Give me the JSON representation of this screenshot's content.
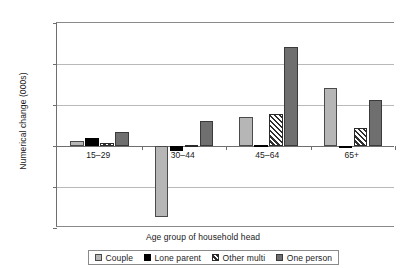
{
  "chart_data": {
    "type": "bar",
    "title": "",
    "xlabel": "Age group of household head",
    "ylabel": "Numerical change (000s)",
    "categories": [
      "15–29",
      "30–44",
      "45–64",
      "65+"
    ],
    "series": [
      {
        "name": "Couple",
        "values": [
          55,
          -870,
          350,
          710
        ]
      },
      {
        "name": "Lone parent",
        "values": [
          95,
          -65,
          10,
          5
        ]
      },
      {
        "name": "Other multi",
        "values": [
          40,
          10,
          390,
          215
        ]
      },
      {
        "name": "One person",
        "values": [
          165,
          300,
          1210,
          560
        ]
      }
    ],
    "ylim": [
      -1000,
      1500
    ],
    "ytick_labels": [
      "1,500",
      "1,000",
      "500",
      "0",
      "-500",
      "-1,000"
    ],
    "ytick_values": [
      1500,
      1000,
      500,
      0,
      -500,
      -1000
    ],
    "grid": true,
    "legend_position": "bottom",
    "colors": {
      "couple": "#b6b6b6",
      "lone_parent": "#000000",
      "other_multi": "#ffffff",
      "one_person": "#6f6f6f",
      "gridline": "#b9b9b9",
      "axis": "#6e6e6e"
    }
  },
  "legend": {
    "items": [
      {
        "label": "Couple",
        "icon": "swatch-couple-icon"
      },
      {
        "label": "Lone parent",
        "icon": "swatch-lone-parent-icon"
      },
      {
        "label": "Other multi",
        "icon": "swatch-other-multi-icon"
      },
      {
        "label": "One person",
        "icon": "swatch-one-person-icon"
      }
    ]
  }
}
